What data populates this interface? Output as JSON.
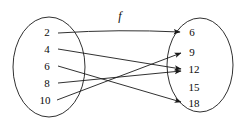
{
  "figure": {
    "type": "arrow-diagram",
    "map_label": "f",
    "stroke_color": "#1a1a1a",
    "text_color": "#0a0a0a",
    "background": "#ffffff",
    "domain": {
      "name": "domain-set",
      "items": [
        {
          "value": "2",
          "cx": 47,
          "cy": 32
        },
        {
          "value": "4",
          "cx": 47,
          "cy": 49
        },
        {
          "value": "6",
          "cx": 47,
          "cy": 66
        },
        {
          "value": "8",
          "cx": 47,
          "cy": 83
        },
        {
          "value": "10",
          "cx": 45,
          "cy": 100
        }
      ],
      "ellipse": {
        "cx": 49,
        "cy": 67,
        "rx": 36,
        "ry": 50
      }
    },
    "codomain": {
      "name": "codomain-set",
      "items": [
        {
          "value": "6",
          "cx": 192,
          "cy": 32
        },
        {
          "value": "9",
          "cx": 192,
          "cy": 52
        },
        {
          "value": "12",
          "cx": 194,
          "cy": 69
        },
        {
          "value": "15",
          "cx": 194,
          "cy": 87
        },
        {
          "value": "18",
          "cx": 194,
          "cy": 103
        }
      ],
      "ellipse": {
        "cx": 200,
        "cy": 65,
        "rx": 33,
        "ry": 47
      }
    },
    "mappings": [
      {
        "from": "2",
        "to": "6",
        "x1": 58,
        "y1": 33,
        "x2": 180,
        "y2": 32
      },
      {
        "from": "4",
        "to": "12",
        "x1": 58,
        "y1": 49,
        "x2": 181,
        "y2": 69
      },
      {
        "from": "6",
        "to": "18",
        "x1": 58,
        "y1": 66,
        "x2": 181,
        "y2": 102
      },
      {
        "from": "8",
        "to": "12",
        "x1": 58,
        "y1": 83,
        "x2": 181,
        "y2": 71
      },
      {
        "from": "10",
        "to": "9",
        "x1": 57,
        "y1": 100,
        "x2": 181,
        "y2": 53
      }
    ],
    "map_label_pos": {
      "x": 120,
      "y": 16
    }
  }
}
